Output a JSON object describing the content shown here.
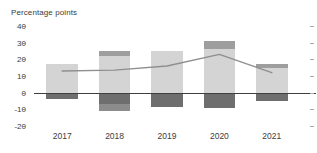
{
  "chart_data": {
    "type": "bar",
    "title": "Percentage points",
    "xlabel": "",
    "ylabel": "Percentage points",
    "ylim": [
      -20,
      40
    ],
    "yticks": [
      40,
      30,
      20,
      10,
      0,
      -10,
      -20
    ],
    "ytick_labels": [
      "40",
      "30",
      "20",
      "10",
      "0",
      "-10",
      "-20"
    ],
    "grid": false,
    "legend": "none",
    "stacked": true,
    "categories": [
      "2017",
      "2018",
      "2019",
      "2020",
      "2021"
    ],
    "series": [
      {
        "name": "light-grey-positive",
        "color": "#d4d4d4",
        "values": [
          17.5,
          22.0,
          25.0,
          26.0,
          15.0
        ]
      },
      {
        "name": "medium-grey-positive",
        "color": "#9e9e9e",
        "values": [
          0.0,
          3.0,
          0.0,
          5.0,
          2.0
        ]
      },
      {
        "name": "dark-grey-negative",
        "color": "#6e6e6e",
        "values": [
          -4.0,
          -7.0,
          -8.5,
          -9.0,
          -5.0
        ]
      },
      {
        "name": "darker-grey-negative",
        "color": "#8c8c8c",
        "values": [
          0.0,
          -4.0,
          0.0,
          0.0,
          0.0
        ]
      }
    ],
    "line_series": {
      "name": "total-line",
      "color": "#8f8f8f",
      "x": [
        "2017",
        "2018",
        "2019",
        "2020",
        "2021"
      ],
      "values": [
        13.0,
        13.5,
        16.0,
        23.0,
        12.0
      ]
    }
  },
  "axis": {
    "right_tick_count": 7
  }
}
